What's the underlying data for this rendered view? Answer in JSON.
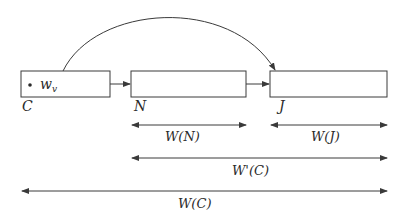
{
  "diagram": {
    "stroke_color": "#3a3a3a",
    "nodes": [
      {
        "id": "C",
        "label": "C",
        "inner_label": "w_v",
        "inner_text_main": "w",
        "inner_text_sub": "v",
        "has_dot": true
      },
      {
        "id": "N",
        "label": "N"
      },
      {
        "id": "J",
        "label": "J"
      }
    ],
    "edges": [
      {
        "from": "C",
        "to": "N",
        "type": "straight"
      },
      {
        "from": "N",
        "to": "J",
        "type": "straight"
      },
      {
        "from": "C",
        "to": "J",
        "type": "arc"
      }
    ],
    "measures": [
      {
        "id": "W_N",
        "label": "W(N)",
        "from": "N",
        "to": "N"
      },
      {
        "id": "W_J",
        "label": "W(J)",
        "from": "J",
        "to": "J"
      },
      {
        "id": "Wprime_C",
        "label": "W'(C)",
        "from": "N",
        "to": "J"
      },
      {
        "id": "W_C",
        "label": "W(C)",
        "from": "C",
        "to": "J"
      }
    ]
  }
}
